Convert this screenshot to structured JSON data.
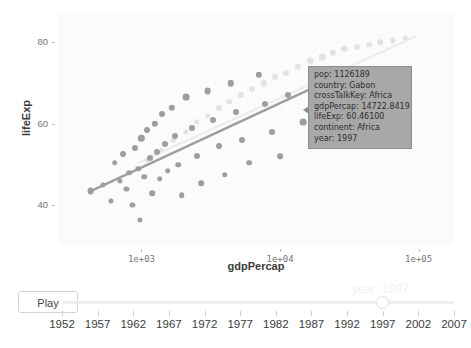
{
  "chart_data": {
    "type": "scatter",
    "title": "",
    "xlabel": "gdpPercap",
    "ylabel": "lifeExp",
    "xscale": "log",
    "xlim": [
      250,
      180000
    ],
    "ylim": [
      30,
      87
    ],
    "grid": false,
    "legend": "none",
    "xticks": [
      "1e+03",
      "1e+04",
      "1e+05"
    ],
    "xtick_values": [
      1000,
      10000,
      100000
    ],
    "yticks": [
      "40",
      "60",
      "80"
    ],
    "ytick_values": [
      40,
      60,
      80
    ],
    "series": [
      {
        "name": "other-continents",
        "style": "dimmed",
        "color": "#e3e3e3",
        "points": [
          {
            "x": 1100,
            "y": 51.0,
            "r": 2.4
          },
          {
            "x": 1400,
            "y": 53.5,
            "r": 2.4
          },
          {
            "x": 1700,
            "y": 56.0,
            "r": 2.6
          },
          {
            "x": 2100,
            "y": 58.0,
            "r": 2.6
          },
          {
            "x": 2500,
            "y": 60.5,
            "r": 2.8
          },
          {
            "x": 3000,
            "y": 62.0,
            "r": 2.6
          },
          {
            "x": 3600,
            "y": 64.0,
            "r": 3.0
          },
          {
            "x": 4300,
            "y": 65.5,
            "r": 2.8
          },
          {
            "x": 5200,
            "y": 67.0,
            "r": 3.0
          },
          {
            "x": 6300,
            "y": 68.5,
            "r": 3.0
          },
          {
            "x": 7600,
            "y": 70.0,
            "r": 3.2
          },
          {
            "x": 9200,
            "y": 71.5,
            "r": 3.2
          },
          {
            "x": 11000,
            "y": 72.5,
            "r": 3.0
          },
          {
            "x": 13500,
            "y": 74.0,
            "r": 3.2
          },
          {
            "x": 16500,
            "y": 75.5,
            "r": 3.2
          },
          {
            "x": 20000,
            "y": 76.5,
            "r": 3.4
          },
          {
            "x": 24000,
            "y": 77.5,
            "r": 3.2
          },
          {
            "x": 29000,
            "y": 78.5,
            "r": 3.2
          },
          {
            "x": 36000,
            "y": 79.0,
            "r": 3.0
          },
          {
            "x": 44000,
            "y": 79.5,
            "r": 2.8
          },
          {
            "x": 53000,
            "y": 80.0,
            "r": 2.8
          },
          {
            "x": 65000,
            "y": 80.5,
            "r": 2.6
          },
          {
            "x": 80000,
            "y": 81.0,
            "r": 2.4
          }
        ]
      },
      {
        "name": "africa",
        "style": "highlighted",
        "color": "#9e9e9e",
        "points": [
          {
            "x": 430,
            "y": 43.5,
            "r": 3.4
          },
          {
            "x": 530,
            "y": 45.0,
            "r": 2.6
          },
          {
            "x": 600,
            "y": 41.0,
            "r": 2.6
          },
          {
            "x": 640,
            "y": 50.5,
            "r": 2.8
          },
          {
            "x": 700,
            "y": 46.0,
            "r": 2.6
          },
          {
            "x": 740,
            "y": 52.5,
            "r": 3.0
          },
          {
            "x": 780,
            "y": 44.0,
            "r": 2.6
          },
          {
            "x": 820,
            "y": 48.0,
            "r": 2.8
          },
          {
            "x": 860,
            "y": 40.0,
            "r": 2.6
          },
          {
            "x": 900,
            "y": 54.0,
            "r": 3.0
          },
          {
            "x": 950,
            "y": 49.0,
            "r": 2.8
          },
          {
            "x": 980,
            "y": 36.5,
            "r": 2.6
          },
          {
            "x": 1000,
            "y": 56.5,
            "r": 3.2
          },
          {
            "x": 1050,
            "y": 47.0,
            "r": 2.8
          },
          {
            "x": 1100,
            "y": 58.5,
            "r": 3.0
          },
          {
            "x": 1150,
            "y": 51.5,
            "r": 3.0
          },
          {
            "x": 1200,
            "y": 43.0,
            "r": 2.8
          },
          {
            "x": 1250,
            "y": 60.0,
            "r": 3.2
          },
          {
            "x": 1300,
            "y": 53.0,
            "r": 3.0
          },
          {
            "x": 1350,
            "y": 46.5,
            "r": 2.8
          },
          {
            "x": 1400,
            "y": 62.5,
            "r": 3.0
          },
          {
            "x": 1480,
            "y": 55.0,
            "r": 3.0
          },
          {
            "x": 1550,
            "y": 48.5,
            "r": 2.8
          },
          {
            "x": 1650,
            "y": 64.0,
            "r": 3.2
          },
          {
            "x": 1750,
            "y": 57.0,
            "r": 3.0
          },
          {
            "x": 1850,
            "y": 50.0,
            "r": 2.8
          },
          {
            "x": 1950,
            "y": 42.5,
            "r": 2.8
          },
          {
            "x": 2100,
            "y": 66.5,
            "r": 3.4
          },
          {
            "x": 2300,
            "y": 59.0,
            "r": 3.0
          },
          {
            "x": 2500,
            "y": 52.0,
            "r": 3.0
          },
          {
            "x": 2700,
            "y": 45.5,
            "r": 2.8
          },
          {
            "x": 3000,
            "y": 68.0,
            "r": 3.4
          },
          {
            "x": 3300,
            "y": 61.0,
            "r": 3.0
          },
          {
            "x": 3600,
            "y": 54.5,
            "r": 3.0
          },
          {
            "x": 4000,
            "y": 47.5,
            "r": 2.8
          },
          {
            "x": 4400,
            "y": 70.0,
            "r": 3.2
          },
          {
            "x": 4800,
            "y": 63.0,
            "r": 3.0
          },
          {
            "x": 5300,
            "y": 56.0,
            "r": 3.0
          },
          {
            "x": 6000,
            "y": 50.5,
            "r": 2.8
          },
          {
            "x": 7000,
            "y": 72.0,
            "r": 3.2
          },
          {
            "x": 7800,
            "y": 65.0,
            "r": 3.0
          },
          {
            "x": 8800,
            "y": 58.0,
            "r": 3.0
          },
          {
            "x": 10000,
            "y": 52.0,
            "r": 2.8
          },
          {
            "x": 11500,
            "y": 67.0,
            "r": 3.0
          },
          {
            "x": 14722.8419,
            "y": 60.461,
            "r": 3.4
          }
        ]
      }
    ],
    "trend_lines": [
      {
        "name": "africa-trend",
        "color": "#9e9e9e",
        "width": 2.4,
        "x0": 430,
        "y0": 43.5,
        "x1": 22000,
        "y1": 70.5
      },
      {
        "name": "other-trend",
        "color": "#ececec",
        "width": 2.2,
        "x0": 950,
        "y0": 50.5,
        "x1": 95000,
        "y1": 81.5
      }
    ],
    "tooltip": {
      "target_x": 14722.8419,
      "target_y": 60.461,
      "rows": [
        {
          "key": "pop:",
          "value": "1126189"
        },
        {
          "key": "country:",
          "value": "Gabon"
        },
        {
          "key": "crossTalkKey:",
          "value": "Africa"
        },
        {
          "key": "gdpPercap:",
          "value": "14722.8419"
        },
        {
          "key": "lifeExp:",
          "value": "60.46100"
        },
        {
          "key": "continent:",
          "value": "Africa"
        },
        {
          "key": "year:",
          "value": "1997"
        }
      ],
      "background_color": "#a8a8a8",
      "border_color": "#8d8d8d"
    }
  },
  "controls": {
    "play_label": "Play",
    "ghost_label": "year: 1997",
    "slider": {
      "current_value": "1997",
      "min": "1952",
      "max": "2007",
      "step": "5",
      "ticks": [
        "1952",
        "1957",
        "1962",
        "1967",
        "1972",
        "1977",
        "1982",
        "1987",
        "1992",
        "1997",
        "2002",
        "2007"
      ]
    }
  }
}
